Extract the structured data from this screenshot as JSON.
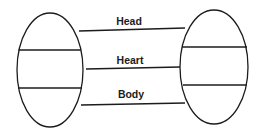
{
  "diagram": {
    "canvas": {
      "width": 258,
      "height": 134,
      "background": "#ffffff"
    },
    "stroke_color": "#1c1c1c",
    "nodes": [
      {
        "id": "left-ellipse",
        "cx": 50,
        "cy": 70,
        "rx": 33,
        "ry": 57,
        "sections": [
          "top",
          "middle",
          "bottom"
        ],
        "dividers": [
          {
            "y": 50,
            "x1": 18.5,
            "x2": 81
          },
          {
            "y": 88,
            "x1": 18,
            "x2": 82
          }
        ]
      },
      {
        "id": "right-ellipse",
        "cx": 214,
        "cy": 67,
        "rx": 34,
        "ry": 57,
        "sections": [
          "top",
          "middle",
          "bottom"
        ],
        "dividers": [
          {
            "y": 47,
            "x1": 182,
            "x2": 247
          },
          {
            "y": 85,
            "x1": 183,
            "x2": 247
          }
        ]
      }
    ],
    "connections": [
      {
        "label": "Head",
        "x1": 79,
        "y1": 31,
        "x2": 185,
        "y2": 28,
        "label_x": 129,
        "label_y": 25
      },
      {
        "label": "Heart",
        "x1": 86,
        "y1": 69,
        "x2": 180,
        "y2": 67,
        "label_x": 130,
        "label_y": 64
      },
      {
        "label": "Body",
        "x1": 81,
        "y1": 105,
        "x2": 185,
        "y2": 103,
        "label_x": 131,
        "label_y": 98
      }
    ]
  }
}
